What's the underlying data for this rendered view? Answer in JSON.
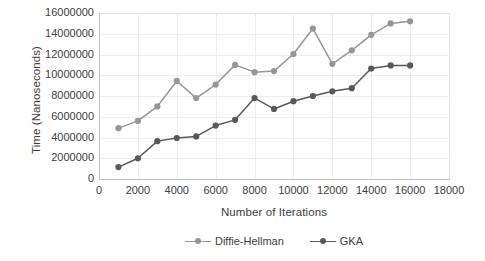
{
  "chart_data": {
    "type": "line",
    "title": "",
    "xlabel": "Number of Iterations",
    "ylabel": "Time (Nanoseconds)",
    "x": [
      1000,
      2000,
      3000,
      4000,
      5000,
      6000,
      7000,
      8000,
      9000,
      10000,
      11000,
      12000,
      13000,
      14000,
      15000,
      16000
    ],
    "series": [
      {
        "name": "Diffie-Hellman",
        "color": "#969696",
        "values": [
          4900000,
          5600000,
          7000000,
          9450000,
          7800000,
          9100000,
          11000000,
          10300000,
          10400000,
          12050000,
          14500000,
          11100000,
          12400000,
          13900000,
          15000000,
          15200000
        ]
      },
      {
        "name": "GKA",
        "color": "#595959",
        "values": [
          1150000,
          2000000,
          3650000,
          3950000,
          4100000,
          5150000,
          5700000,
          7800000,
          6750000,
          7500000,
          8000000,
          8450000,
          8750000,
          10650000,
          10950000,
          10950000
        ]
      }
    ],
    "xlim": [
      0,
      18000
    ],
    "ylim": [
      0,
      16000000
    ],
    "xticks": [
      "0",
      "2000",
      "4000",
      "6000",
      "8000",
      "10000",
      "12000",
      "14000",
      "16000",
      "18000"
    ],
    "yticks": [
      "0",
      "2000000",
      "4000000",
      "6000000",
      "8000000",
      "10000000",
      "12000000",
      "14000000",
      "16000000"
    ],
    "grid": true,
    "legend_position": "bottom",
    "marker": "circle"
  },
  "legend": {
    "items": [
      {
        "label": "Diffie-Hellman",
        "color": "#969696"
      },
      {
        "label": "GKA",
        "color": "#595959"
      }
    ]
  }
}
